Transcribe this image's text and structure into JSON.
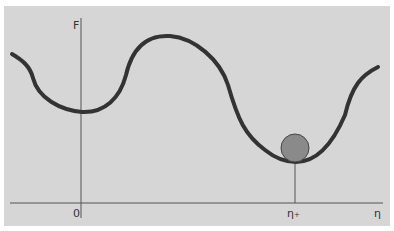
{
  "diagram": {
    "type": "free-energy landscape",
    "y_axis_label": "F",
    "x_axis_label": "η",
    "origin_label": "0",
    "equilibrium_label": "η₊",
    "colors": {
      "panel_background": "#d6d6d6",
      "curve": "#333333",
      "axes": "#555555",
      "ball_fill": "#8a8a8a",
      "ball_stroke": "#444444"
    },
    "elements": [
      {
        "name": "energy-curve",
        "description": "wavy free-energy curve with a local minimum at η=0, a maximum, and a deeper global minimum at η₊"
      },
      {
        "name": "ball",
        "description": "gray ball resting in the global minimum at η₊"
      },
      {
        "name": "equilibrium-marker",
        "description": "vertical line from the global minimum down to the η axis"
      }
    ]
  }
}
